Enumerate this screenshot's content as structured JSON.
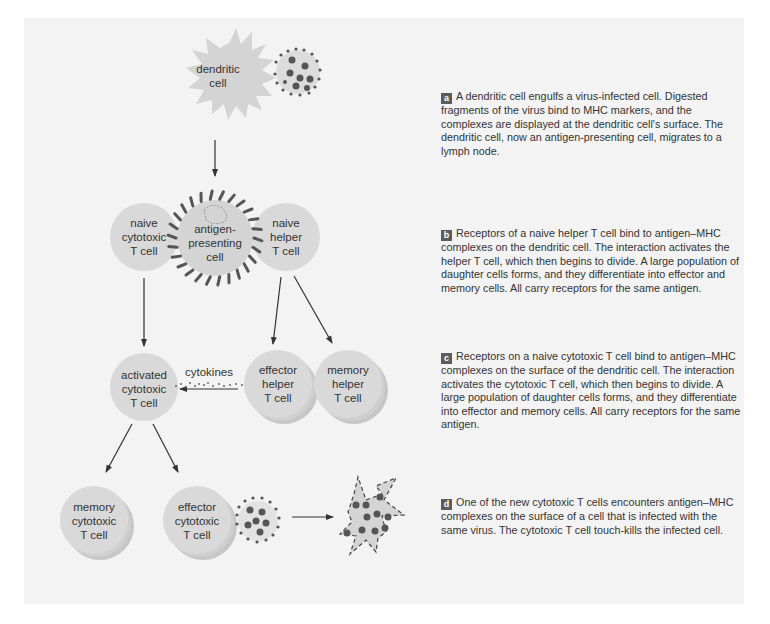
{
  "diagram": {
    "colors": {
      "background": "#ffffff",
      "panel": "#f3f3f3",
      "cell_fill": "#d9d9d9",
      "cell_stack_shadow": "#c6c6c6",
      "dot_dark": "#555555",
      "text": "#333333",
      "badge": "#5c5c5c",
      "arrow": "#333333"
    },
    "cells": {
      "dendritic": "dendritic\ncell",
      "antigen_presenting": "antigen-\npresenting\ncell",
      "naive_cytotoxic": "naive\ncytotoxic\nT cell",
      "naive_helper": "naive\nhelper\nT cell",
      "activated_cytotoxic": "activated\ncytotoxic\nT cell",
      "effector_helper": "effector\nhelper\nT cell",
      "memory_helper": "memory\nhelper\nT cell",
      "memory_cytotoxic": "memory\ncytotoxic\nT cell",
      "effector_cytotoxic": "effector\ncytotoxic\nT cell"
    },
    "cytokines_label": "cytokines",
    "steps": [
      {
        "badge": "a",
        "text": "A dendritic cell engulfs a virus-infected cell. Digested fragments of the virus bind to MHC markers, and the complexes are displayed at the dendritic cell's surface. The dendritic cell, now an antigen-presenting cell, migrates to a lymph node."
      },
      {
        "badge": "b",
        "text": "Receptors of a naive helper T cell bind to antigen–MHC complexes on the dendritic cell. The interaction activates the helper T cell, which then begins to divide. A large population of daughter cells forms, and they differentiate into effector and memory cells. All carry receptors for the same antigen."
      },
      {
        "badge": "c",
        "text": "Receptors on a naive cytotoxic T cell bind to antigen–MHC complexes on the surface of the dendritic cell. The interaction activates the cytotoxic T cell, which then begins to divide. A large population of daughter cells forms, and they differentiate into effector and memory cells. All carry receptors for the same antigen."
      },
      {
        "badge": "d",
        "text": "One of the new cytotoxic T cells encounters antigen–MHC complexes on the surface of a cell that is infected with the same virus. The cytotoxic T cell touch-kills the infected cell."
      }
    ]
  }
}
